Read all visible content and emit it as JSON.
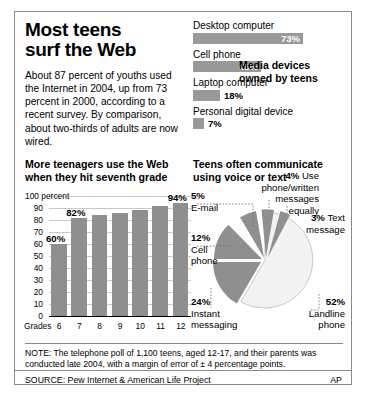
{
  "headline": "Most teens\nsurf the Web",
  "intro": "About 87 percent of youths used the Internet in 2004, up from 73 percent in 2000, according to a recent survey. By comparison, about two-thirds of adults are now wired.",
  "devices": {
    "title": "Media devices owned by teens",
    "items": [
      {
        "label": "Desktop computer",
        "value": 73,
        "display": "73%"
      },
      {
        "label": "Cell phone",
        "value": 45,
        "display": "45%"
      },
      {
        "label": "Laptop computer",
        "value": 18,
        "display": "18%"
      },
      {
        "label": "Personal digital device",
        "value": 7,
        "display": "7%"
      }
    ]
  },
  "grade_chart_title": "More teenagers use the Web when they hit seventh grade",
  "pie_title": "Teens often communicate using voice or text",
  "note": "NOTE: The telephone poll of 1,100 teens, aged 12-17, and their parents was conducted late 2004, with a margin of error of ± 4 percentage points.",
  "source": "SOURCE: Pew Internet & American Life Project",
  "credit": "AP",
  "chart_data": [
    {
      "type": "bar",
      "title": "More teenagers use the Web when they hit seventh grade",
      "categories": [
        "6",
        "7",
        "8",
        "9",
        "10",
        "11",
        "12"
      ],
      "x_axis_prefix": "Grades",
      "values": [
        60,
        82,
        84,
        86,
        88,
        92,
        94
      ],
      "data_labels": {
        "0": "60%",
        "1": "82%",
        "6": "94%"
      },
      "yticks": [
        0,
        10,
        20,
        30,
        40,
        50,
        60,
        70,
        80,
        90,
        100
      ],
      "ytick_labels": [
        "0",
        "10",
        "20",
        "30",
        "40",
        "50",
        "60",
        "70",
        "80",
        "90",
        "100 percent"
      ],
      "ylim": [
        0,
        100
      ],
      "xlabel": "",
      "ylabel": "",
      "grid": true,
      "legend": "none",
      "bar_color": "#8f8f8f"
    },
    {
      "type": "bar",
      "title": "Media devices owned by teens",
      "categories": [
        "Desktop computer",
        "Cell phone",
        "Laptop computer",
        "Personal digital device"
      ],
      "values": [
        73,
        45,
        18,
        7
      ],
      "data_labels": [
        "73%",
        "45%",
        "18%",
        "7%"
      ],
      "ylim": [
        0,
        100
      ],
      "orientation": "horizontal",
      "grid": false,
      "legend": "none",
      "bar_color": "#999999"
    },
    {
      "type": "pie",
      "title": "Teens often communicate using voice or text",
      "labels": [
        "Landline phone",
        "Instant messaging",
        "Cell phone",
        "E-mail",
        "Use phone/written messages equally",
        "Text message"
      ],
      "values": [
        52,
        24,
        12,
        5,
        4,
        3
      ],
      "display_values": [
        "52%",
        "24%",
        "12%",
        "5%",
        "4%",
        "3%"
      ],
      "legend": "callouts"
    }
  ],
  "pie_labels": [
    {
      "pct": "5%",
      "text": "E-mail"
    },
    {
      "pct": "12%",
      "text": "Cell phone"
    },
    {
      "pct": "24%",
      "text": "Instant messaging"
    },
    {
      "pct": "4%",
      "text": "Use phone/written messages equally"
    },
    {
      "pct": "3%",
      "text": "Text message"
    },
    {
      "pct": "52%",
      "text": "Landline phone"
    }
  ]
}
